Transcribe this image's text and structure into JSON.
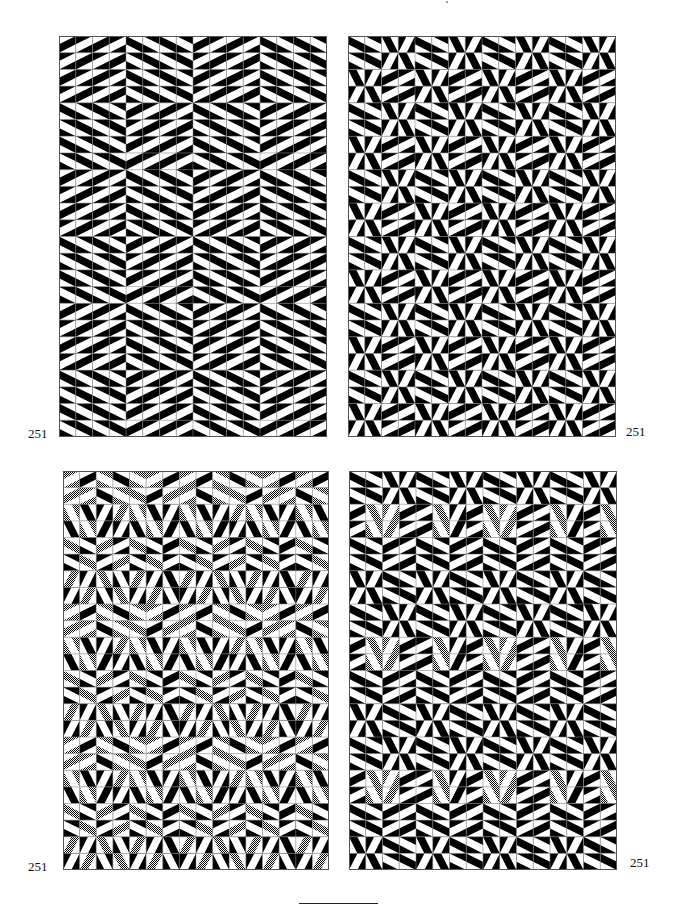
{
  "page": {
    "plate_number": "251",
    "background": "#ffffff",
    "ink": "#000000",
    "grid_line": "#888888",
    "hatch_light": "#ffffff",
    "hatch_dark": "#000000"
  },
  "tile_legend": {
    "a": "shallow band sloping down-right, band black",
    "b": "shallow band sloping up-right, band black",
    "c": "steep band sloping down-right, band black",
    "d": "steep band sloping up-right, band black",
    "A": "shallow down-right, colors inverted",
    "B": "shallow up-right, colors inverted",
    "C": "steep down-right, colors inverted",
    "D": "steep up-right, colors inverted",
    "suffix_h": "black replaced by hatched gray"
  },
  "panels": [
    {
      "id": "top-left",
      "x": 59,
      "y": 36,
      "width": 268,
      "height": 401,
      "cols": 16,
      "rows": 24,
      "label": "251",
      "label_x": 28,
      "label_y": 427,
      "motif": [
        "aAaAbBbB",
        "AaAaBbBb",
        "aAaAbBbB",
        "AaAabBbB",
        "bBbBaAaA",
        "BbBbAaAa",
        "bBbBaAaA",
        "BbBbAaAa"
      ],
      "motif_shift": {
        "x": 0,
        "y": 4
      }
    },
    {
      "id": "top-right",
      "x": 348,
      "y": 36,
      "width": 268,
      "height": 401,
      "cols": 16,
      "rows": 24,
      "label": "251",
      "label_x": 626,
      "label_y": 425,
      "motif": [
        "aAcDaAcD",
        "AaDcAaDc",
        "cDbBcDbB",
        "DcBbDcBb",
        "aAcDaAcD",
        "AaDcAaDc",
        "cDbBcDbB",
        "DcBbDcBb"
      ],
      "motif_shift": {
        "x": 0,
        "y": 0
      }
    },
    {
      "id": "bottom-left",
      "x": 63,
      "y": 471,
      "width": 266,
      "height": 399,
      "cols": 16,
      "rows": 24,
      "label": "251",
      "label_x": 28,
      "label_y": 860,
      "motif": [
        "Bh.b.Ah.aAh.Bh.b",
        "bh.Bh.a.Ah.ah.b.",
        "Ch.c.D.dh.Ch.c.D",
        "c.Ch.d.D.c.Ch.d.",
        "ah.A.bh.B.ah.A.b",
        "A.ah.B.bh.A.ah.B",
        "dh.D.ch.C.dh.D.c",
        "D.dh.C.ch.D.dh.C"
      ],
      "motif_shift": {
        "x": 0,
        "y": 0
      }
    },
    {
      "id": "bottom-right",
      "x": 349,
      "y": 471,
      "width": 268,
      "height": 399,
      "cols": 16,
      "rows": 24,
      "label": "251",
      "label_x": 630,
      "label_y": 856,
      "motif": [
        "a.A.c.D.a.A.c.D.",
        "A.a.D.c.A.a.D.c.",
        "b.ch.Dh.b.B.ch.D",
        "B.Ch.dh.B.b.Ch.d",
        "a.A.b.B.a.A.b.B.",
        "A.a.B.b.A.a.B.b.",
        "c.D.a.A.c.D.a.A.",
        "D.c.A.a.D.c.A.a."
      ],
      "motif_shift": {
        "x": 0,
        "y": 0
      }
    }
  ],
  "footer": {
    "rule": {
      "x": 299,
      "y": 903,
      "width": 79
    }
  },
  "header": {
    "mark": {
      "x": 446,
      "y": 1
    }
  }
}
